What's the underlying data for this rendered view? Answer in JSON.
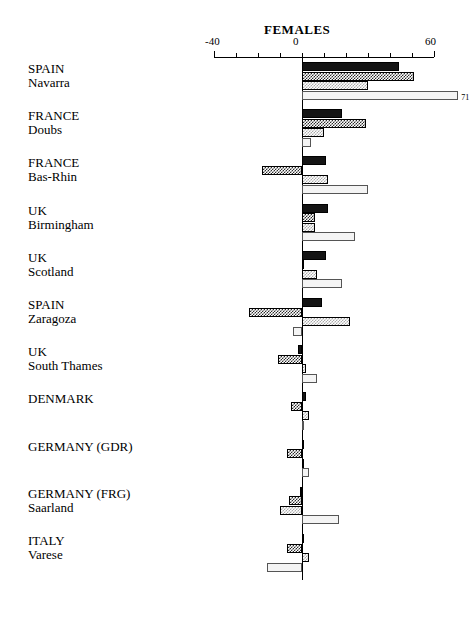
{
  "chart_data": {
    "type": "bar",
    "orientation": "horizontal",
    "title": "FEMALES",
    "xlabel": "",
    "ylabel": "",
    "xlim": [
      -40,
      60
    ],
    "grid": false,
    "legend": "none",
    "axis_tick_labels": [
      "-40",
      "0",
      "60"
    ],
    "axis_tick_values": [
      -40,
      0,
      60
    ],
    "axis_minor_tick_values": [
      -40,
      -30,
      -20,
      -10,
      0,
      10,
      20,
      30,
      40,
      50,
      60
    ],
    "categories": [
      "SPAIN Navarra",
      "FRANCE Doubs",
      "FRANCE Bas-Rhin",
      "UK Birmingham",
      "UK Scotland",
      "SPAIN Zaragoza",
      "UK South Thames",
      "DENMARK",
      "GERMANY (GDR)",
      "GERMANY (FRG) Saarland",
      "ITALY Varese"
    ],
    "series": [
      {
        "name": "series-1",
        "fill": "solid-black",
        "values": [
          44,
          18,
          11,
          12,
          11,
          9,
          -2,
          2,
          0,
          -1,
          1
        ]
      },
      {
        "name": "series-2",
        "fill": "dark-checker",
        "values": [
          51,
          29,
          -18,
          6,
          1,
          -24,
          -11,
          -5,
          -7,
          -6,
          -7
        ]
      },
      {
        "name": "series-3",
        "fill": "light-checker",
        "values": [
          30,
          10,
          12,
          6,
          7,
          22,
          2,
          3,
          0,
          -10,
          3
        ]
      },
      {
        "name": "series-4",
        "fill": "white-outline",
        "values": [
          71,
          4,
          30,
          24,
          18,
          -4,
          7,
          1,
          3,
          17,
          -16
        ]
      }
    ],
    "data_labels": [
      {
        "group": "SPAIN Navarra",
        "series": "series-4",
        "text": "71"
      }
    ]
  },
  "rows": [
    {
      "line1": "SPAIN",
      "line2": "Navarra"
    },
    {
      "line1": "FRANCE",
      "line2": "Doubs"
    },
    {
      "line1": "FRANCE",
      "line2": "Bas-Rhin"
    },
    {
      "line1": "UK",
      "line2": "Birmingham"
    },
    {
      "line1": "UK",
      "line2": "Scotland"
    },
    {
      "line1": "SPAIN",
      "line2": "Zaragoza"
    },
    {
      "line1": "UK",
      "line2": "South Thames"
    },
    {
      "line1": "DENMARK",
      "line2": ""
    },
    {
      "line1": "GERMANY (GDR)",
      "line2": ""
    },
    {
      "line1": "GERMANY (FRG)",
      "line2": "Saarland"
    },
    {
      "line1": "ITALY",
      "line2": "Varese"
    }
  ],
  "colors": {
    "series_1": "#141414",
    "series_2": "#2b2b2b",
    "series_3": "#aaaaaa",
    "series_4": "#f4f4f4",
    "axis": "#000000",
    "background": "#ffffff"
  }
}
